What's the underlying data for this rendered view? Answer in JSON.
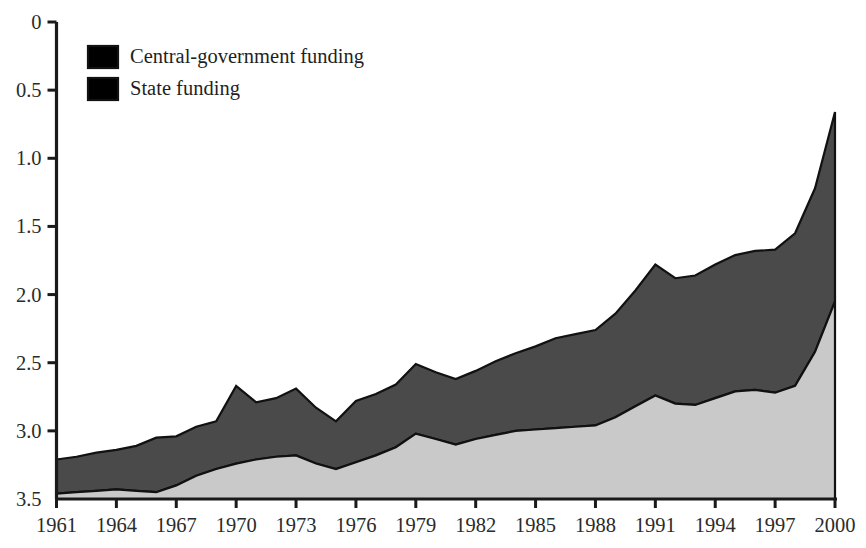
{
  "chart_data": {
    "type": "area",
    "stacked": true,
    "title": "",
    "subtitle": "",
    "xlabel": "",
    "ylabel": "",
    "xlim": [
      1961,
      2000
    ],
    "ylim": [
      0,
      3.5
    ],
    "grid": false,
    "legend_position": "top-left",
    "x": [
      1961,
      1962,
      1963,
      1964,
      1965,
      1966,
      1967,
      1968,
      1969,
      1970,
      1971,
      1972,
      1973,
      1974,
      1975,
      1976,
      1977,
      1978,
      1979,
      1980,
      1981,
      1982,
      1983,
      1984,
      1985,
      1986,
      1987,
      1988,
      1989,
      1990,
      1991,
      1992,
      1993,
      1994,
      1995,
      1996,
      1997,
      1998,
      1999,
      2000
    ],
    "xticks": [
      1961,
      1964,
      1967,
      1970,
      1973,
      1976,
      1979,
      1982,
      1985,
      1988,
      1991,
      1994,
      1997,
      2000
    ],
    "xticklabels": [
      "1961",
      "1964",
      "1967",
      "1970",
      "1973",
      "1976",
      "1979",
      "1982",
      "1985",
      "1988",
      "1991",
      "1994",
      "1997",
      "2000"
    ],
    "yticks": [
      0,
      0.5,
      1.0,
      1.5,
      2.0,
      2.5,
      3.0,
      3.5
    ],
    "yticklabels": [
      "0",
      "0.5",
      "1.0",
      "1.5",
      "2.0",
      "2.5",
      "3.0",
      "3.5"
    ],
    "series": [
      {
        "name": "Central-government funding",
        "color": "#c9c9c9",
        "values": [
          0.04,
          0.05,
          0.06,
          0.07,
          0.06,
          0.05,
          0.1,
          0.17,
          0.22,
          0.26,
          0.29,
          0.31,
          0.32,
          0.26,
          0.22,
          0.27,
          0.32,
          0.38,
          0.48,
          0.44,
          0.4,
          0.44,
          0.47,
          0.5,
          0.51,
          0.52,
          0.53,
          0.54,
          0.6,
          0.68,
          0.76,
          0.7,
          0.69,
          0.74,
          0.79,
          0.8,
          0.78,
          0.83,
          1.08,
          1.45
        ]
      },
      {
        "name": "State funding",
        "color": "#4a4a4a",
        "values": [
          0.25,
          0.26,
          0.28,
          0.29,
          0.33,
          0.4,
          0.36,
          0.36,
          0.35,
          0.57,
          0.42,
          0.43,
          0.49,
          0.41,
          0.35,
          0.45,
          0.45,
          0.46,
          0.51,
          0.49,
          0.48,
          0.5,
          0.54,
          0.57,
          0.61,
          0.66,
          0.68,
          0.7,
          0.76,
          0.85,
          0.96,
          0.92,
          0.95,
          0.98,
          1.0,
          1.02,
          1.05,
          1.12,
          1.2,
          1.39
        ]
      }
    ],
    "totals": [
      0.29,
      0.31,
      0.34,
      0.36,
      0.39,
      0.45,
      0.46,
      0.53,
      0.57,
      0.83,
      0.71,
      0.74,
      0.81,
      0.67,
      0.57,
      0.72,
      0.77,
      0.84,
      0.99,
      0.93,
      0.88,
      0.94,
      1.01,
      1.07,
      1.12,
      1.18,
      1.21,
      1.24,
      1.36,
      1.53,
      1.72,
      1.62,
      1.64,
      1.72,
      1.79,
      1.82,
      1.83,
      1.95,
      2.28,
      2.84
    ]
  },
  "legend": {
    "items": [
      {
        "label": "Central-government funding",
        "color": "#c9c9c9"
      },
      {
        "label": "State funding",
        "color": "#4a4a4a"
      }
    ]
  },
  "axes": {
    "y_labels": [
      "3.5",
      "3.0",
      "2.5",
      "2.0",
      "1.5",
      "1.0",
      "0.5",
      "0"
    ],
    "x_labels": [
      "1961",
      "1964",
      "1967",
      "1970",
      "1973",
      "1976",
      "1979",
      "1982",
      "1985",
      "1988",
      "1991",
      "1994",
      "1997",
      "2000"
    ]
  },
  "colors": {
    "light_fill": "#c9c9c9",
    "dark_fill": "#4a4a4a",
    "outline": "#111111",
    "axis": "#1a1a1a",
    "background": "#ffffff"
  }
}
